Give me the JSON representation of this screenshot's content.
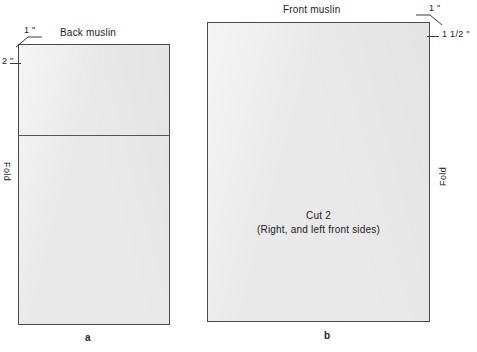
{
  "figure": {
    "panels": [
      {
        "id": "a",
        "title": "Back muslin",
        "caption": "a",
        "fold_label": "Fold",
        "dimensions": [
          {
            "name": "top-corner-allowance",
            "value": "1 \""
          },
          {
            "name": "side-allowance",
            "value": "2 \""
          }
        ]
      },
      {
        "id": "b",
        "title": "Front muslin",
        "caption": "b",
        "fold_label": "Fold",
        "dimensions": [
          {
            "name": "top-corner-allowance",
            "value": "1 \""
          },
          {
            "name": "side-allowance",
            "value": "1 1/2 \""
          }
        ],
        "instructions": {
          "line1": "Cut 2",
          "line2": "(Right, and left front sides)"
        }
      }
    ]
  },
  "colors": {
    "piece_fill": "#e9e9e9",
    "piece_border": "#4a4a4a",
    "text": "#1c1c1c",
    "background": "#ffffff"
  }
}
